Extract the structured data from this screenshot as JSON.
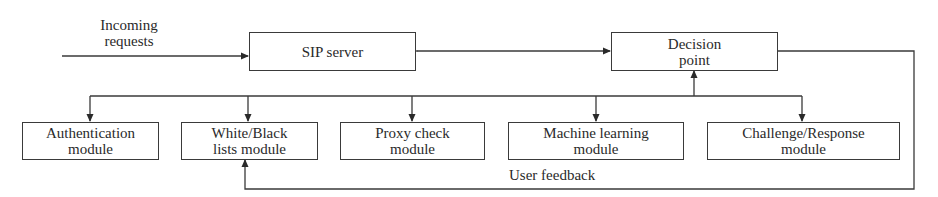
{
  "diagram": {
    "input": {
      "label_line1": "Incoming",
      "label_line2": "requests"
    },
    "nodes": {
      "sip_server": {
        "line1": "SIP server"
      },
      "decision_point": {
        "line1": "Decision",
        "line2": "point"
      }
    },
    "modules": [
      {
        "id": "authentication",
        "line1": "Authentication",
        "line2": "module"
      },
      {
        "id": "white_black_lists",
        "line1": "White/Black",
        "line2": "lists module"
      },
      {
        "id": "proxy_check",
        "line1": "Proxy check",
        "line2": "module"
      },
      {
        "id": "machine_learning",
        "line1": "Machine learning",
        "line2": "module"
      },
      {
        "id": "challenge_response",
        "line1": "Challenge/Response",
        "line2": "module"
      }
    ],
    "feedback": {
      "label": "User feedback"
    },
    "edges": [
      {
        "from": "incoming_requests",
        "to": "sip_server",
        "type": "arrow"
      },
      {
        "from": "sip_server",
        "to": "decision_point",
        "type": "bidirectional"
      },
      {
        "from": "modules_bus",
        "to": "decision_point",
        "type": "arrow"
      },
      {
        "from": "modules_bus",
        "to": "authentication",
        "type": "arrow"
      },
      {
        "from": "modules_bus",
        "to": "white_black_lists",
        "type": "arrow"
      },
      {
        "from": "modules_bus",
        "to": "proxy_check",
        "type": "arrow"
      },
      {
        "from": "modules_bus",
        "to": "machine_learning",
        "type": "arrow"
      },
      {
        "from": "modules_bus",
        "to": "challenge_response",
        "type": "arrow"
      },
      {
        "from": "decision_point",
        "to": "white_black_lists",
        "type": "feedback-loop",
        "label": "User feedback"
      }
    ],
    "colors": {
      "line": "#3a3a3a",
      "text": "#2a2a2a",
      "background": "#ffffff"
    }
  }
}
